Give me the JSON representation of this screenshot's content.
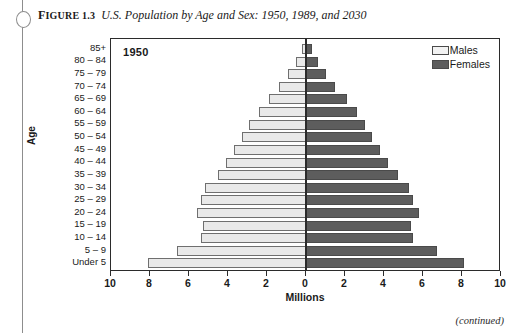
{
  "page": {
    "figure_label_prefix": "F",
    "figure_label_rest": "IGURE",
    "figure_number": "1.3",
    "figure_title": "U.S. Population by Age and Sex: 1950, 1989, and 2030",
    "continued_note": "(continued)"
  },
  "legend": {
    "position": "top-right",
    "items": [
      {
        "label": "Males",
        "color": "#f2f2f2"
      },
      {
        "label": "Females",
        "color": "#5d5d5d"
      }
    ]
  },
  "chart_data": {
    "type": "bar",
    "subtype": "population-pyramid",
    "title": "U.S. Population by Age and Sex: 1950, 1989, and 2030",
    "annotation": "1950",
    "xlabel": "Millions",
    "ylabel": "Age",
    "grid": false,
    "xlim": [
      -10,
      10
    ],
    "xticks": [
      -10,
      -8,
      -6,
      -4,
      -2,
      0,
      2,
      4,
      6,
      8,
      10
    ],
    "xtick_labels": [
      "10",
      "8",
      "6",
      "4",
      "2",
      "0",
      "2",
      "4",
      "6",
      "8",
      "10"
    ],
    "categories": [
      "85+",
      "80 – 84",
      "75 – 79",
      "70 – 74",
      "65 – 69",
      "60 – 64",
      "55 – 59",
      "50 – 54",
      "45 – 49",
      "40 – 44",
      "35 – 39",
      "30 – 34",
      "25 – 29",
      "20 – 24",
      "15 – 19",
      "10 – 14",
      "5 – 9",
      "Under 5"
    ],
    "series": [
      {
        "name": "Males",
        "color": "#e9e9e9",
        "side": "left",
        "values": [
          0.2,
          0.5,
          0.9,
          1.4,
          1.9,
          2.4,
          2.9,
          3.3,
          3.7,
          4.1,
          4.5,
          5.2,
          5.4,
          5.6,
          5.3,
          5.4,
          6.6,
          8.1
        ]
      },
      {
        "name": "Females",
        "color": "#5d5d5d",
        "side": "right",
        "values": [
          0.3,
          0.6,
          1.0,
          1.5,
          2.1,
          2.6,
          3.0,
          3.4,
          3.8,
          4.2,
          4.7,
          5.3,
          5.5,
          5.8,
          5.4,
          5.5,
          6.7,
          8.1
        ]
      }
    ]
  }
}
